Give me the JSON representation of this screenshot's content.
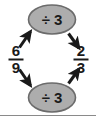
{
  "diagram": {
    "type": "fraction-simplification-flow",
    "background_color": "#ffffff",
    "stroke_color": "#1a1a1a",
    "node_fill_color": "#adadad",
    "node_stroke_color": "#4d4d4d",
    "start_fraction": {
      "label": "6/9",
      "numerator": "6",
      "denominator": "9"
    },
    "result_fraction": {
      "label": "2/3",
      "numerator": "2",
      "denominator": "3"
    },
    "operations": [
      {
        "id": "top",
        "label": "÷ 3",
        "divisor": "3",
        "applies_to": "numerator"
      },
      {
        "id": "bottom",
        "label": "÷ 3",
        "divisor": "3",
        "applies_to": "denominator"
      }
    ],
    "arrows": [
      {
        "id": "num-to-op",
        "from": "6/9",
        "to": "÷ 3 (top)",
        "direction": "up-right"
      },
      {
        "id": "op-to-result",
        "from": "÷ 3 (top)",
        "to": "2/3",
        "direction": "down-right"
      },
      {
        "id": "den-to-op",
        "from": "6/9",
        "to": "÷ 3 (bottom)",
        "direction": "down-right"
      },
      {
        "id": "op-to-result-2",
        "from": "÷ 3 (bottom)",
        "to": "2/3",
        "direction": "up-right"
      }
    ]
  }
}
